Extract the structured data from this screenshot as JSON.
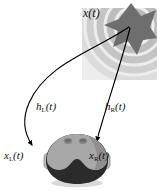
{
  "figure": {
    "name": "binaural-hrtf-diagram",
    "background_color": "#ffffff"
  },
  "labels": {
    "source": {
      "base": "x",
      "sub": "",
      "arg": "(t)",
      "text": "x(t)"
    },
    "left_impulse_response": {
      "base": "h",
      "sub": "L",
      "arg": "(t)",
      "text": "hL(t)"
    },
    "right_impulse_response": {
      "base": "h",
      "sub": "R",
      "arg": "(t)",
      "text": "hR(t)"
    },
    "left_ear_signal": {
      "base": "x",
      "sub": "L",
      "arg": "(t)",
      "text": "xL(t)"
    },
    "right_ear_signal": {
      "base": "x",
      "sub": "R",
      "arg": "(t)",
      "text": "xR(t)"
    }
  },
  "colors": {
    "star_fill": "#6e6e6e",
    "wave_light": "#e4e4e4",
    "wave_mid": "#d3d3d3",
    "wave_dark": "#c2c2c2",
    "panel": "#e9e9e9",
    "head_dark": "#2b2b2b",
    "head_light": "#a8a8a8",
    "head_mid": "#8f8f8f",
    "ear": "#bdbdbd",
    "stroke": "#000000",
    "text": "#111111"
  },
  "elements": {
    "sound_source": "star-icon",
    "listener": "head-icon",
    "left_ear": "left-ear-icon",
    "right_ear": "right-ear-icon",
    "left_path": "left-propagation-arrow",
    "right_path": "right-propagation-arrow",
    "wavefronts": "concentric-wavefront-arcs"
  }
}
